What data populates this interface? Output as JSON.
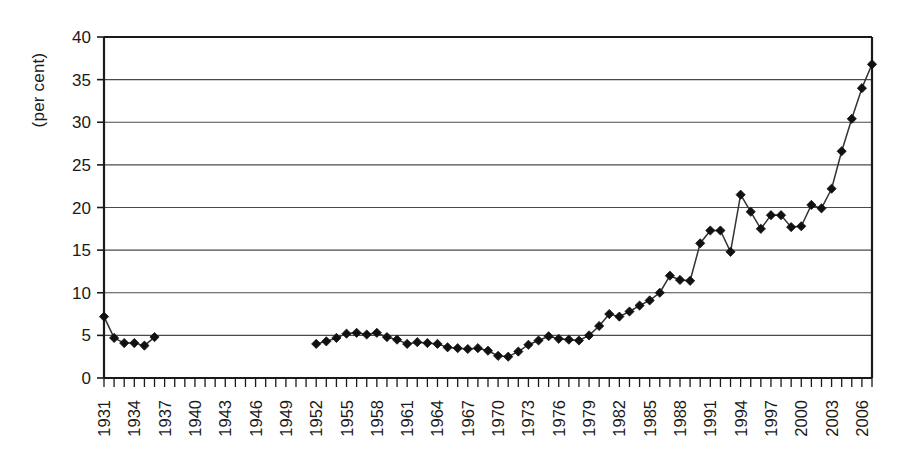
{
  "chart_data": {
    "type": "line",
    "title": "",
    "xlabel": "",
    "ylabel": "(per cent)",
    "ylim": [
      0,
      40
    ],
    "ytick_step": 5,
    "yticks": [
      0,
      5,
      10,
      15,
      20,
      25,
      30,
      35,
      40
    ],
    "xlim": [
      1931,
      2007
    ],
    "xtick_labels": [
      "1931",
      "1934",
      "1937",
      "1940",
      "1943",
      "1946",
      "1949",
      "1952",
      "1955",
      "1958",
      "1961",
      "1964",
      "1967",
      "1970",
      "1973",
      "1976",
      "1979",
      "1982",
      "1985",
      "1988",
      "1991",
      "1994",
      "1997",
      "2000",
      "2003",
      "2006"
    ],
    "xtick_label_step": 3,
    "xtick_minor_step": 1,
    "grid": "horizontal",
    "legend": "none",
    "marker": "diamond",
    "marker_color": "#111111",
    "line_color": "#333333",
    "series": [
      {
        "name": "series-1",
        "points": [
          [
            1931,
            7.2
          ],
          [
            1932,
            4.7
          ],
          [
            1933,
            4.1
          ],
          [
            1934,
            4.1
          ],
          [
            1935,
            3.8
          ],
          [
            1936,
            4.8
          ],
          [
            1952,
            4.0
          ],
          [
            1953,
            4.3
          ],
          [
            1954,
            4.7
          ],
          [
            1955,
            5.2
          ],
          [
            1956,
            5.3
          ],
          [
            1957,
            5.1
          ],
          [
            1958,
            5.3
          ],
          [
            1959,
            4.8
          ],
          [
            1960,
            4.5
          ],
          [
            1961,
            4.0
          ],
          [
            1962,
            4.2
          ],
          [
            1963,
            4.1
          ],
          [
            1964,
            4.0
          ],
          [
            1965,
            3.6
          ],
          [
            1966,
            3.5
          ],
          [
            1967,
            3.4
          ],
          [
            1968,
            3.5
          ],
          [
            1969,
            3.2
          ],
          [
            1970,
            2.6
          ],
          [
            1971,
            2.5
          ],
          [
            1972,
            3.1
          ],
          [
            1973,
            3.9
          ],
          [
            1974,
            4.4
          ],
          [
            1975,
            4.9
          ],
          [
            1976,
            4.6
          ],
          [
            1977,
            4.5
          ],
          [
            1978,
            4.4
          ],
          [
            1979,
            5.0
          ],
          [
            1980,
            6.1
          ],
          [
            1981,
            7.5
          ],
          [
            1982,
            7.2
          ],
          [
            1983,
            7.8
          ],
          [
            1984,
            8.5
          ],
          [
            1985,
            9.1
          ],
          [
            1986,
            10.0
          ],
          [
            1987,
            12.0
          ],
          [
            1988,
            11.5
          ],
          [
            1989,
            11.4
          ],
          [
            1990,
            15.8
          ],
          [
            1991,
            17.3
          ],
          [
            1992,
            17.3
          ],
          [
            1993,
            14.8
          ],
          [
            1994,
            21.5
          ],
          [
            1995,
            19.5
          ],
          [
            1996,
            17.5
          ],
          [
            1997,
            19.1
          ],
          [
            1998,
            19.1
          ],
          [
            1999,
            17.7
          ],
          [
            2000,
            17.8
          ],
          [
            2001,
            20.3
          ],
          [
            2002,
            19.9
          ],
          [
            2003,
            22.2
          ],
          [
            2004,
            26.6
          ],
          [
            2005,
            30.4
          ],
          [
            2006,
            34.0
          ],
          [
            2007,
            36.8
          ]
        ]
      }
    ]
  }
}
